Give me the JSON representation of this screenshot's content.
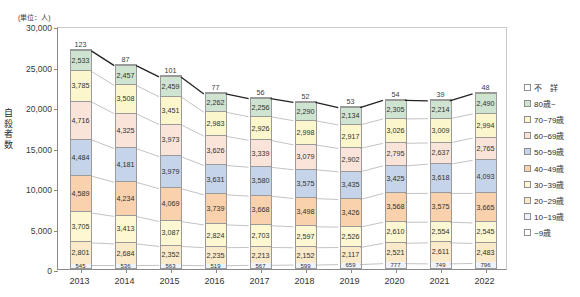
{
  "unit_caption": "(単位：人)",
  "yaxis_title": "自殺者数",
  "footnote": "",
  "axis": {
    "y_ticks": [
      "0",
      "5,000",
      "10,000",
      "15,000",
      "20,000",
      "25,000",
      "30,000"
    ],
    "y_min": 0,
    "y_max": 30000
  },
  "legend": {
    "items": [
      {
        "label": "不　詳",
        "color": "#ffffff"
      },
      {
        "label": "80歳~",
        "color": "#cfe3d1"
      },
      {
        "label": "70~79歳",
        "color": "#fcf6cd"
      },
      {
        "label": "60~69歳",
        "color": "#fae4d9"
      },
      {
        "label": "50~59歳",
        "color": "#c6d4e9"
      },
      {
        "label": "40~49歳",
        "color": "#f9d2ad"
      },
      {
        "label": "30~39歳",
        "color": "#fdf7d2"
      },
      {
        "label": "20~29歳",
        "color": "#fbeac9"
      },
      {
        "label": "10~19歳",
        "color": "#eef2fb"
      },
      {
        "label": "~9歳",
        "color": "#ffffff"
      }
    ]
  },
  "chart_data": {
    "type": "bar",
    "stacked": true,
    "title": "",
    "xlabel": "",
    "ylabel": "自殺者数",
    "unit": "人",
    "ylim": [
      0,
      30000
    ],
    "grid": false,
    "legend_position": "right",
    "categories": [
      "2013",
      "2014",
      "2015",
      "2016",
      "2017",
      "2018",
      "2019",
      "2020",
      "2021",
      "2022"
    ],
    "series": [
      {
        "name": "~9歳",
        "color": "#ffffff",
        "values": [
          0,
          0,
          0,
          0,
          0,
          0,
          0,
          0,
          0,
          0
        ]
      },
      {
        "name": "10~19歳",
        "color": "#eef2fb",
        "values": [
          545,
          536,
          563,
          519,
          567,
          599,
          659,
          777,
          749,
          796
        ]
      },
      {
        "name": "20~29歳",
        "color": "#fbeac9",
        "values": [
          2801,
          2684,
          2352,
          2235,
          2213,
          2152,
          2117,
          2521,
          2611,
          2483
        ]
      },
      {
        "name": "30~39歳",
        "color": "#fdf7d2",
        "values": [
          3705,
          3413,
          3087,
          2824,
          2703,
          2597,
          2526,
          2610,
          2554,
          2545
        ]
      },
      {
        "name": "40~49歳",
        "color": "#f9d2ad",
        "values": [
          4589,
          4234,
          4069,
          3739,
          3668,
          3498,
          3426,
          3568,
          3575,
          3665
        ]
      },
      {
        "name": "50~59歳",
        "color": "#c6d4e9",
        "values": [
          4484,
          4181,
          3979,
          3631,
          3580,
          3575,
          3435,
          3425,
          3618,
          4093
        ]
      },
      {
        "name": "60~69歳",
        "color": "#fae4d9",
        "values": [
          4716,
          4325,
          3973,
          3626,
          3339,
          3079,
          2902,
          2795,
          2637,
          2765
        ]
      },
      {
        "name": "70~79歳",
        "color": "#fcf6cd",
        "values": [
          3785,
          3508,
          3451,
          2983,
          2926,
          2998,
          2917,
          3026,
          3009,
          2994
        ]
      },
      {
        "name": "80歳~",
        "color": "#cfe3d1",
        "values": [
          2533,
          2457,
          2459,
          2262,
          2256,
          2290,
          2134,
          2305,
          2214,
          2490
        ]
      },
      {
        "name": "不詳",
        "color": "#ffffff",
        "values": [
          123,
          87,
          101,
          77,
          56,
          52,
          53,
          54,
          39,
          48
        ]
      }
    ],
    "top_values": [
      123,
      87,
      101,
      77,
      56,
      52,
      53,
      54,
      39,
      48
    ],
    "totals": [
      27283,
      25427,
      24034,
      21896,
      21308,
      20840,
      20169,
      21081,
      21006,
      21879
    ]
  }
}
